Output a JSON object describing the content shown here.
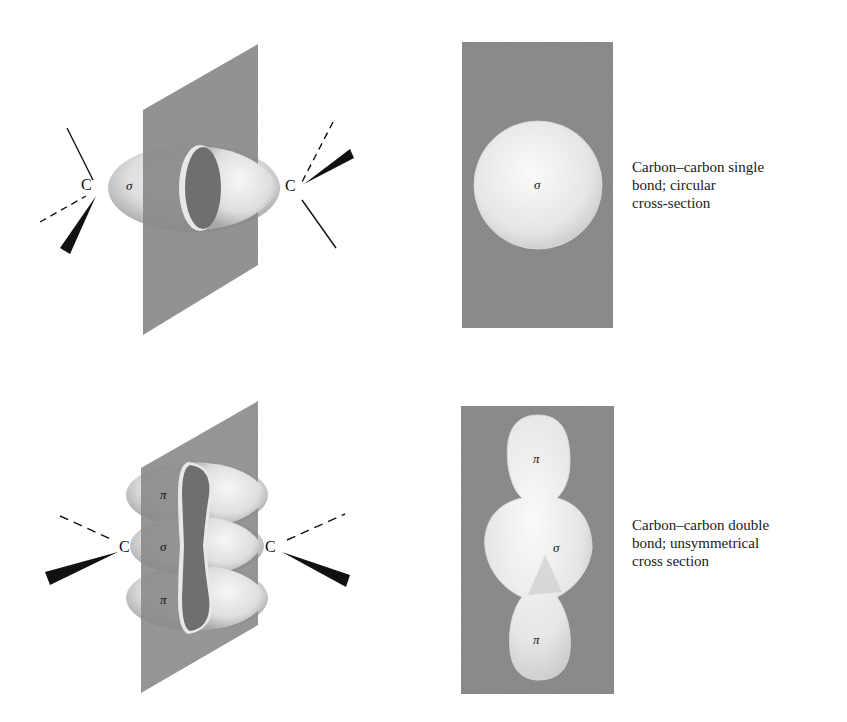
{
  "figure": {
    "single_bond": {
      "perspective_view": {
        "atom_left": "C",
        "atom_right": "C",
        "orbital_label": "σ"
      },
      "cross_section": {
        "orbital_label": "σ"
      },
      "caption": {
        "line1": "Carbon–carbon single",
        "line2": "bond; circular",
        "line3": "cross-section"
      }
    },
    "double_bond": {
      "perspective_view": {
        "atom_left": "C",
        "atom_right": "C",
        "orbital_top": "π",
        "orbital_middle": "σ",
        "orbital_bottom": "π"
      },
      "cross_section": {
        "orbital_top": "π",
        "orbital_middle": "σ",
        "orbital_bottom": "π"
      },
      "caption": {
        "line1": "Carbon–carbon double",
        "line2": "bond; unsymmetrical",
        "line3": "cross section"
      }
    },
    "colors": {
      "plane": "#8a8a8a",
      "orbital_light": "#f4f4f4",
      "orbital_shade": "#bdbdbd",
      "ink": "#111111"
    }
  }
}
